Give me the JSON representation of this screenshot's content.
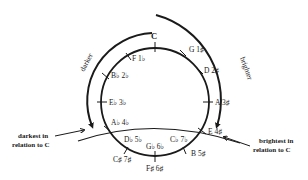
{
  "diagram": {
    "type": "circle-of-fifths",
    "top_key": "C",
    "keys": [
      {
        "name": "C",
        "label": "C",
        "signature": ""
      },
      {
        "name": "G",
        "label": "G 1♯",
        "signature": "1 sharp"
      },
      {
        "name": "D",
        "label": "D 2♯",
        "signature": "2 sharps"
      },
      {
        "name": "A",
        "label": "A 3♯",
        "signature": "3 sharps"
      },
      {
        "name": "E",
        "label": "E 4♯",
        "signature": "4 sharps"
      },
      {
        "name": "B",
        "label": "B 5♯",
        "signature": "5 sharps"
      },
      {
        "name": "F#",
        "label": "F♯ 6♯",
        "signature": "6 sharps"
      },
      {
        "name": "Gb",
        "label": "G♭ 6♭",
        "signature": "6 flats"
      },
      {
        "name": "C#",
        "label": "C♯ 7♯",
        "signature": "7 sharps"
      },
      {
        "name": "Cb",
        "label": "C♭ 7♭",
        "signature": "7 flats"
      },
      {
        "name": "Db",
        "label": "D♭ 5♭",
        "signature": "5 flats"
      },
      {
        "name": "Ab",
        "label": "A♭ 4♭",
        "signature": "4 flats"
      },
      {
        "name": "Eb",
        "label": "E♭ 3♭",
        "signature": "3 flats"
      },
      {
        "name": "Bb",
        "label": "B♭ 2♭",
        "signature": "2 flats"
      },
      {
        "name": "F",
        "label": "F 1♭",
        "signature": "1 flat"
      }
    ],
    "arcs": {
      "left": {
        "label": "darker",
        "direction": "counterclockwise"
      },
      "right": {
        "label": "brighter",
        "direction": "clockwise"
      }
    },
    "annotations": {
      "left": {
        "line1": "darkest in",
        "line2": "relation to C"
      },
      "right": {
        "line1": "brightest in",
        "line2": "relation to C"
      }
    }
  }
}
